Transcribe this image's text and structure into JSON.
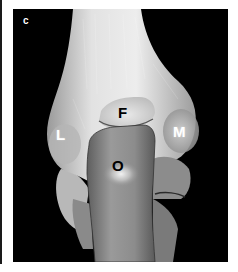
{
  "figure": {
    "panel_letter": "c",
    "labels": [
      {
        "id": "L",
        "text": "L",
        "color": "#ffffff"
      },
      {
        "id": "F",
        "text": "F",
        "color": "#000000"
      },
      {
        "id": "M",
        "text": "M",
        "color": "#ffffff"
      },
      {
        "id": "O",
        "text": "O",
        "color": "#000000"
      }
    ]
  },
  "colors": {
    "background": "#ffffff",
    "panel": "#000000",
    "bone_light": "#e6e6e6",
    "bone_mid": "#a8a8a8",
    "bone_dark": "#6e6e6e"
  }
}
